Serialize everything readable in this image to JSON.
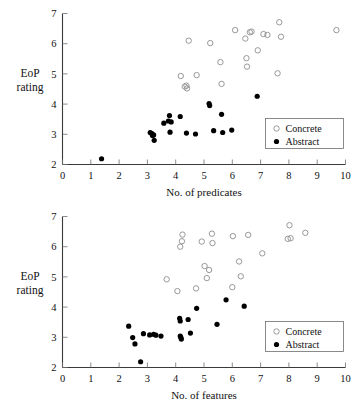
{
  "chart_data": [
    {
      "id": "predicates",
      "type": "scatter",
      "title": "",
      "xlabel": "No. of predicates",
      "ylabel": "EoP rating",
      "ylabel_lines": [
        "EoP",
        "rating"
      ],
      "xlim": [
        0,
        10
      ],
      "ylim": [
        2,
        7
      ],
      "xticks": [
        0,
        1,
        2,
        3,
        4,
        5,
        6,
        7,
        8,
        9,
        10
      ],
      "yticks": [
        2,
        3,
        4,
        5,
        6,
        7
      ],
      "grid": false,
      "legend_position": "bottom-right",
      "legend": [
        {
          "name": "Concrete",
          "marker": "open-circle"
        },
        {
          "name": "Abstract",
          "marker": "filled-circle"
        }
      ],
      "series": [
        {
          "name": "Concrete",
          "marker": "open-circle",
          "color": "#8d8d8d",
          "points": [
            [
              4.18,
              4.93
            ],
            [
              4.32,
              4.58
            ],
            [
              4.38,
              4.61
            ],
            [
              4.4,
              4.52
            ],
            [
              4.46,
              6.1
            ],
            [
              4.74,
              4.96
            ],
            [
              5.22,
              6.02
            ],
            [
              5.58,
              5.39
            ],
            [
              5.62,
              4.67
            ],
            [
              6.1,
              6.45
            ],
            [
              6.46,
              6.17
            ],
            [
              6.5,
              5.52
            ],
            [
              6.52,
              5.24
            ],
            [
              6.62,
              6.38
            ],
            [
              6.68,
              6.4
            ],
            [
              6.9,
              5.78
            ],
            [
              7.1,
              6.32
            ],
            [
              7.24,
              6.29
            ],
            [
              7.6,
              5.02
            ],
            [
              7.66,
              6.71
            ],
            [
              7.72,
              6.23
            ],
            [
              9.68,
              6.45
            ]
          ]
        },
        {
          "name": "Abstract",
          "marker": "filled-circle",
          "color": "#000000",
          "points": [
            [
              1.38,
              2.19
            ],
            [
              3.1,
              3.06
            ],
            [
              3.16,
              3.02
            ],
            [
              3.18,
              2.96
            ],
            [
              3.22,
              2.98
            ],
            [
              3.24,
              2.8
            ],
            [
              3.58,
              3.37
            ],
            [
              3.74,
              3.44
            ],
            [
              3.78,
              3.62
            ],
            [
              3.8,
              3.07
            ],
            [
              3.84,
              3.41
            ],
            [
              4.16,
              3.59
            ],
            [
              4.38,
              3.04
            ],
            [
              4.7,
              3.01
            ],
            [
              5.18,
              4.02
            ],
            [
              5.2,
              3.95
            ],
            [
              5.34,
              3.12
            ],
            [
              5.62,
              3.66
            ],
            [
              5.66,
              3.06
            ],
            [
              5.98,
              3.14
            ],
            [
              6.88,
              4.26
            ]
          ]
        }
      ]
    },
    {
      "id": "features",
      "type": "scatter",
      "title": "",
      "xlabel": "No. of features",
      "ylabel": "EoP rating",
      "ylabel_lines": [
        "EoP",
        "rating"
      ],
      "xlim": [
        0,
        10
      ],
      "ylim": [
        2,
        7
      ],
      "xticks": [
        0,
        1,
        2,
        3,
        4,
        5,
        6,
        7,
        8,
        9,
        10
      ],
      "yticks": [
        2,
        3,
        4,
        5,
        6,
        7
      ],
      "grid": false,
      "legend_position": "bottom-right",
      "legend": [
        {
          "name": "Concrete",
          "marker": "open-circle"
        },
        {
          "name": "Abstract",
          "marker": "filled-circle"
        }
      ],
      "series": [
        {
          "name": "Concrete",
          "marker": "open-circle",
          "color": "#8d8d8d",
          "points": [
            [
              3.68,
              4.92
            ],
            [
              4.06,
              4.53
            ],
            [
              4.16,
              6.0
            ],
            [
              4.22,
              6.18
            ],
            [
              4.24,
              6.4
            ],
            [
              4.72,
              4.62
            ],
            [
              4.92,
              6.17
            ],
            [
              5.02,
              5.36
            ],
            [
              5.1,
              4.96
            ],
            [
              5.18,
              5.23
            ],
            [
              5.28,
              6.43
            ],
            [
              5.3,
              6.12
            ],
            [
              6.0,
              4.66
            ],
            [
              6.02,
              6.35
            ],
            [
              6.24,
              5.51
            ],
            [
              6.3,
              5.02
            ],
            [
              6.56,
              6.39
            ],
            [
              7.06,
              5.78
            ],
            [
              7.96,
              6.26
            ],
            [
              8.02,
              6.71
            ],
            [
              8.06,
              6.28
            ],
            [
              8.58,
              6.46
            ]
          ]
        },
        {
          "name": "Abstract",
          "marker": "filled-circle",
          "color": "#000000",
          "points": [
            [
              2.34,
              3.37
            ],
            [
              2.48,
              2.99
            ],
            [
              2.56,
              2.78
            ],
            [
              2.76,
              2.19
            ],
            [
              2.86,
              3.12
            ],
            [
              3.08,
              3.08
            ],
            [
              3.22,
              3.1
            ],
            [
              3.3,
              3.07
            ],
            [
              3.48,
              3.04
            ],
            [
              4.14,
              3.63
            ],
            [
              4.16,
              3.54
            ],
            [
              4.16,
              3.04
            ],
            [
              4.18,
              3.0
            ],
            [
              4.2,
              2.94
            ],
            [
              4.44,
              3.59
            ],
            [
              4.52,
              3.14
            ],
            [
              4.74,
              3.96
            ],
            [
              5.46,
              3.43
            ],
            [
              5.78,
              4.24
            ],
            [
              6.42,
              4.03
            ]
          ]
        }
      ]
    }
  ]
}
